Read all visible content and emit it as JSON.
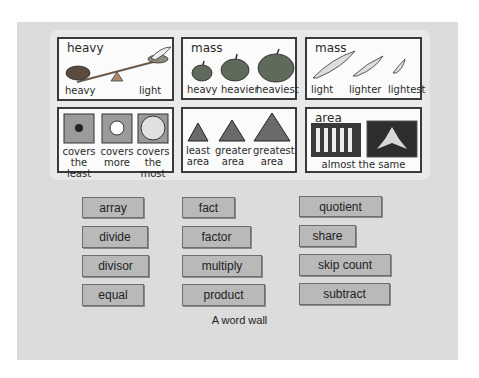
{
  "panels": [
    {
      "title": "heavy",
      "labels": [
        "heavy",
        "light"
      ]
    },
    {
      "title": "mass",
      "labels": [
        "heavy",
        "heavier",
        "heaviest"
      ]
    },
    {
      "title": "mass",
      "labels": [
        "light",
        "lighter",
        "lightest"
      ]
    },
    {
      "title": "",
      "labels": [
        "covers the least",
        "covers more",
        "covers the most"
      ]
    },
    {
      "title": "",
      "labels": [
        "least area",
        "greater area",
        "greatest area"
      ]
    },
    {
      "title": "area",
      "labels": [
        "almost the same"
      ]
    }
  ],
  "words": {
    "col1": [
      "array",
      "divide",
      "divisor",
      "equal"
    ],
    "col2": [
      "fact",
      "factor",
      "multiply",
      "product"
    ],
    "col3": [
      "quotient",
      "share",
      "skip count",
      "subtract"
    ]
  },
  "caption": "A word wall",
  "colors": {
    "word_card": "#b9b9b9",
    "board": "#dcdcdc",
    "panel_border": "#3a3a3a"
  }
}
